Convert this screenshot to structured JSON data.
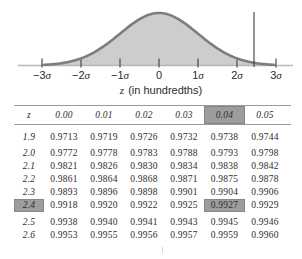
{
  "chart_data": [
    {
      "type": "area",
      "description": "Standard normal (bell) curve with the area under the curve shaded; a vertical marker line crosses the right tail near z = 2.44 between 2σ and 3σ",
      "x_tick_labels": [
        "−3σ",
        "−2σ",
        "−1σ",
        "0",
        "1σ",
        "2σ",
        "3σ"
      ],
      "xlabel": "z (in hundredths)",
      "marker_z": "2.44",
      "fill_color": "#cdcdcd",
      "stroke_color": "#7d7d7d"
    },
    {
      "type": "table",
      "columns": [
        "z",
        "0.00",
        "0.01",
        "0.02",
        "0.03",
        "0.04",
        "0.05"
      ],
      "rows": [
        [
          "1.9",
          "0.9713",
          "0.9719",
          "0.9726",
          "0.9732",
          "0.9738",
          "0.9744"
        ],
        [
          "2.0",
          "0.9772",
          "0.9778",
          "0.9783",
          "0.9788",
          "0.9793",
          "0.9798"
        ],
        [
          "2.1",
          "0.9821",
          "0.9826",
          "0.9830",
          "0.9834",
          "0.9838",
          "0.9842"
        ],
        [
          "2.2",
          "0.9861",
          "0.9864",
          "0.9868",
          "0.9871",
          "0.9875",
          "0.9878"
        ],
        [
          "2.3",
          "0.9893",
          "0.9896",
          "0.9898",
          "0.9901",
          "0.9904",
          "0.9906"
        ],
        [
          "2.4",
          "0.9918",
          "0.9920",
          "0.9922",
          "0.9925",
          "0.9927",
          "0.9929"
        ],
        [
          "2.5",
          "0.9938",
          "0.9940",
          "0.9941",
          "0.9943",
          "0.9945",
          "0.9946"
        ],
        [
          "2.6",
          "0.9953",
          "0.9955",
          "0.9956",
          "0.9957",
          "0.9959",
          "0.9960"
        ]
      ],
      "highlight": {
        "column_label": "0.04",
        "row_label": "2.4",
        "cell_value": "0.9927",
        "col_index": 5,
        "row_index": 5
      },
      "row_group_breaks": [
        1,
        6
      ],
      "highlight_color": "#9d9d9d"
    }
  ]
}
